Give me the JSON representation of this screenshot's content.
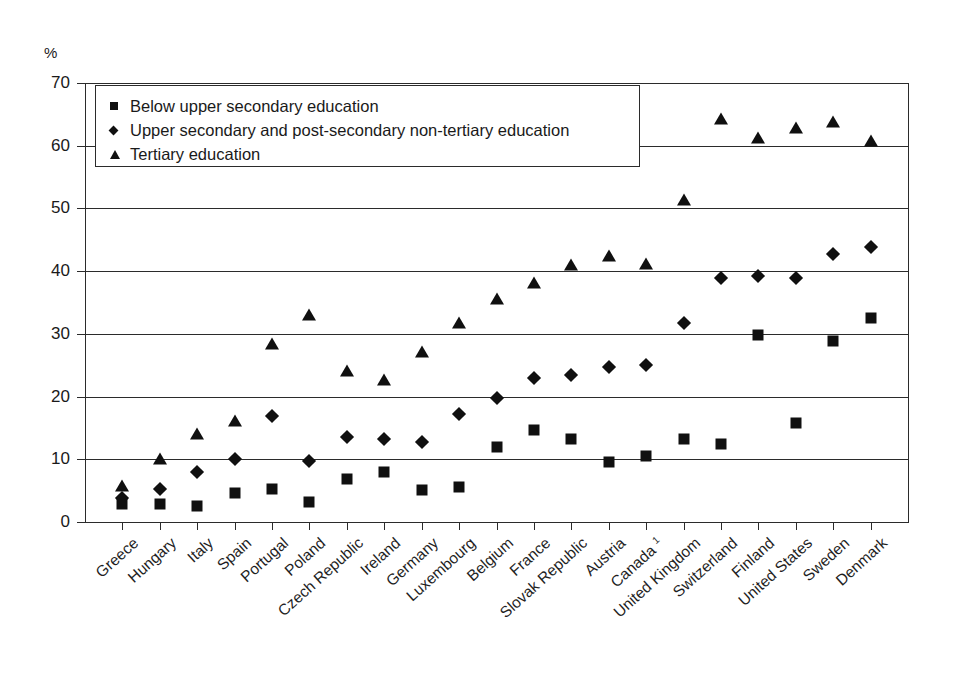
{
  "chart_data": {
    "type": "scatter",
    "title": "",
    "subtitle": "",
    "xlabel": "",
    "ylabel": "%",
    "ylim": [
      0,
      70
    ],
    "yticks": [
      0,
      10,
      20,
      30,
      40,
      50,
      60,
      70
    ],
    "grid": true,
    "legend_position": "top-left",
    "legend": [
      "Below upper secondary education",
      "Upper secondary and post-secondary non-tertiary education",
      "Tertiary education"
    ],
    "categories": [
      "Greece",
      "Hungary",
      "Italy",
      "Spain",
      "Portugal",
      "Poland",
      "Czech Republic",
      "Ireland",
      "Germany",
      "Luxembourg",
      "Belgium",
      "France",
      "Slovak Republic",
      "Austria",
      "Canada",
      "United Kingdom",
      "Switzerland",
      "Finland",
      "United States",
      "Sweden",
      "Denmark"
    ],
    "category_labels": [
      "Greece",
      "Hungary",
      "Italy",
      "Spain",
      "Portugal",
      "Poland",
      "Czech Republic",
      "Ireland",
      "Germany",
      "Luxembourg",
      "Belgium",
      "France",
      "Slovak Republic",
      "Austria",
      "Canada ¹",
      "United Kingdom",
      "Switzerland",
      "Finland",
      "United States",
      "Sweden",
      "Denmark"
    ],
    "series": [
      {
        "name": "Below upper secondary education",
        "marker": "square",
        "color": "#101010",
        "values": [
          2.8,
          2.9,
          2.6,
          4.6,
          5.2,
          3.2,
          6.9,
          8.0,
          5.1,
          5.6,
          12.0,
          14.7,
          13.3,
          9.5,
          10.6,
          13.2,
          12.4,
          29.8,
          15.8,
          28.8,
          32.5
        ]
      },
      {
        "name": "Upper secondary and post-secondary non-tertiary education",
        "marker": "diamond",
        "color": "#101010",
        "values": [
          3.9,
          5.3,
          8.0,
          10.0,
          16.9,
          9.8,
          13.6,
          13.2,
          12.7,
          17.2,
          19.8,
          23.0,
          23.4,
          24.7,
          25.1,
          31.8,
          38.9,
          39.2,
          38.9,
          42.8,
          43.8
        ]
      },
      {
        "name": "Tertiary education",
        "marker": "triangle",
        "color": "#101010",
        "values": [
          5.8,
          10.1,
          14.0,
          16.1,
          28.4,
          33.0,
          24.0,
          22.6,
          27.1,
          31.7,
          35.5,
          38.1,
          41.0,
          42.4,
          41.1,
          51.4,
          64.2,
          61.2,
          62.8,
          63.8,
          60.8
        ]
      }
    ]
  },
  "axis": {
    "y_unit": "%"
  }
}
